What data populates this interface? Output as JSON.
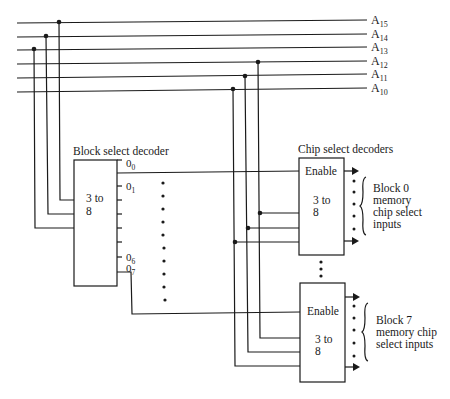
{
  "address_lines": [
    {
      "label": "A",
      "sub": "15",
      "y": 20
    },
    {
      "label": "A",
      "sub": "14",
      "y": 34
    },
    {
      "label": "A",
      "sub": "13",
      "y": 47
    },
    {
      "label": "A",
      "sub": "12",
      "y": 61
    },
    {
      "label": "A",
      "sub": "11",
      "y": 74
    },
    {
      "label": "A",
      "sub": "10",
      "y": 88
    }
  ],
  "block_decoder": {
    "title": "Block select decoder",
    "type_line1": "3 to",
    "type_line2": "8",
    "outputs": [
      {
        "label": "0",
        "sub": "0"
      },
      {
        "label": "0",
        "sub": "1"
      },
      {
        "label": "0",
        "sub": "6"
      },
      {
        "label": "0",
        "sub": "7"
      }
    ]
  },
  "chip_decoders": {
    "title": "Chip select decoders",
    "items": [
      {
        "enable_label": "Enable",
        "type_line1": "3 to",
        "type_line2": "8",
        "caption": [
          "Block 0",
          "memory",
          "chip select",
          "inputs"
        ]
      },
      {
        "enable_label": "Enable",
        "type_line1": "3 to",
        "type_line2": "8",
        "caption": [
          "Block 7",
          "memory chip",
          "select inputs"
        ]
      }
    ]
  },
  "colors": {
    "line": "#1a1a1a",
    "background": "#ffffff"
  }
}
